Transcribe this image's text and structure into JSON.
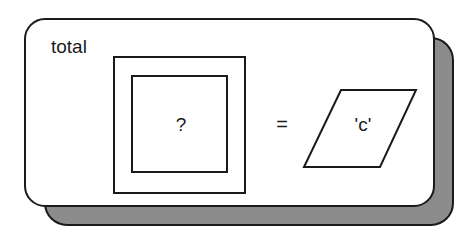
{
  "diagram": {
    "box_label": "total",
    "unknown_symbol": "?",
    "operator": "=",
    "value": "'c'",
    "colors": {
      "stroke": "#1a1a1a",
      "card_fill": "#ffffff",
      "shadow_fill": "#8c8c8c"
    }
  }
}
